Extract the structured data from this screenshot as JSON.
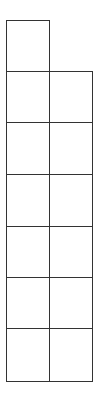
{
  "diagram": {
    "type": "grid-shape",
    "line_color": "#333333",
    "background": "#ffffff",
    "columns_x": [
      6,
      48.5,
      92
    ],
    "rows_y": [
      20,
      71,
      122,
      174,
      226,
      277,
      328,
      381
    ],
    "cells": [
      {
        "row": 0,
        "col": 0
      },
      {
        "row": 1,
        "col": 0
      },
      {
        "row": 1,
        "col": 1
      },
      {
        "row": 2,
        "col": 0
      },
      {
        "row": 2,
        "col": 1
      },
      {
        "row": 3,
        "col": 0
      },
      {
        "row": 3,
        "col": 1
      },
      {
        "row": 4,
        "col": 0
      },
      {
        "row": 4,
        "col": 1
      },
      {
        "row": 5,
        "col": 0
      },
      {
        "row": 5,
        "col": 1
      },
      {
        "row": 6,
        "col": 0
      },
      {
        "row": 6,
        "col": 1
      }
    ]
  }
}
